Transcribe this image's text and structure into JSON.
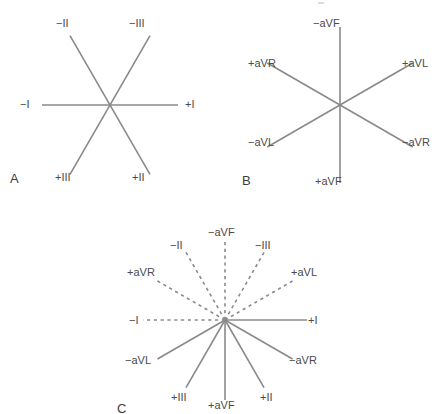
{
  "figure": {
    "background_color": "#ffffff",
    "line_color": "#8a8a8a",
    "text_color": "#4a4a4a",
    "panel_letter_color": "#3c3c3c"
  },
  "panels": [
    {
      "id": "A",
      "letter": "A",
      "caption": "Bipolar limb leads",
      "center": {
        "x": 110,
        "y": 105
      },
      "axes": [
        {
          "name": "lead-I",
          "angle_deg": 0,
          "style": "solid",
          "positive_label": "+I",
          "negative_label": "−I",
          "length": 68
        },
        {
          "name": "lead-II",
          "angle_deg": 60,
          "style": "solid",
          "positive_label": "+II",
          "negative_label": "−II",
          "length": 80
        },
        {
          "name": "lead-III",
          "angle_deg": 120,
          "style": "solid",
          "positive_label": "+III",
          "negative_label": "−III",
          "length": 80
        }
      ],
      "labels": [
        {
          "text": "−II",
          "x": 56,
          "y": 18
        },
        {
          "text": "−III",
          "x": 129,
          "y": 18
        },
        {
          "text": "−I",
          "x": 20,
          "y": 99
        },
        {
          "text": "+I",
          "x": 185,
          "y": 99
        },
        {
          "text": "+III",
          "x": 55,
          "y": 172
        },
        {
          "text": "+II",
          "x": 132,
          "y": 172
        }
      ]
    },
    {
      "id": "B",
      "letter": "B",
      "caption": "Augmented unipolar limb leads",
      "center": {
        "x": 110,
        "y": 105
      },
      "axes": [
        {
          "name": "lead-aVL",
          "angle_deg": 30,
          "style": "solid",
          "positive_label": "+aVL",
          "negative_label": "−aVL",
          "length": 84
        },
        {
          "name": "lead-aVF",
          "angle_deg": 90,
          "style": "solid",
          "positive_label": "+aVF",
          "negative_label": "−aVF",
          "length": 78
        },
        {
          "name": "lead-aVR",
          "angle_deg": 150,
          "style": "solid",
          "positive_label": "+aVR",
          "negative_label": "−aVR",
          "length": 84
        }
      ],
      "labels": [
        {
          "text": "−aVF",
          "x": 83,
          "y": 18
        },
        {
          "text": "+aVR",
          "x": 18,
          "y": 58
        },
        {
          "text": "+aVL",
          "x": 172,
          "y": 58
        },
        {
          "text": "−aVL",
          "x": 18,
          "y": 137
        },
        {
          "text": "−aVR",
          "x": 172,
          "y": 137
        },
        {
          "text": "+aVF",
          "x": 85,
          "y": 176
        }
      ]
    },
    {
      "id": "C",
      "letter": "C",
      "caption": "Complete hexaxial reference system",
      "center": {
        "x": 120,
        "y": 100
      },
      "axes": [
        {
          "name": "lead-I",
          "angle_deg": 0,
          "style_positive": "solid",
          "style_negative": "dashed",
          "positive_label": "+I",
          "negative_label": "−I",
          "length": 82
        },
        {
          "name": "lead-II",
          "angle_deg": 60,
          "style_positive": "solid",
          "style_negative": "dashed",
          "positive_label": "+II",
          "negative_label": "−II",
          "length": 78
        },
        {
          "name": "lead-III",
          "angle_deg": 120,
          "style_positive": "solid",
          "style_negative": "dashed",
          "positive_label": "+III",
          "negative_label": "−III",
          "length": 78
        },
        {
          "name": "lead-aVL",
          "angle_deg": 30,
          "style_positive": "solid",
          "style_negative": "dashed",
          "positive_label": "+aVL",
          "negative_label": "−aVL",
          "length": 78
        },
        {
          "name": "lead-aVF",
          "angle_deg": 90,
          "style_positive": "solid",
          "style_negative": "dashed",
          "positive_label": "+aVF",
          "negative_label": "−aVF",
          "length": 80
        },
        {
          "name": "lead-aVR",
          "angle_deg": 150,
          "style_positive": "solid",
          "style_negative": "dashed",
          "positive_label": "+aVR",
          "negative_label": "−aVR",
          "length": 78
        }
      ],
      "labels": [
        {
          "text": "−aVF",
          "x": 103,
          "y": 7
        },
        {
          "text": "−II",
          "x": 65,
          "y": 20
        },
        {
          "text": "−III",
          "x": 150,
          "y": 20
        },
        {
          "text": "+aVR",
          "x": 22,
          "y": 47
        },
        {
          "text": "+aVL",
          "x": 186,
          "y": 47
        },
        {
          "text": "−I",
          "x": 24,
          "y": 95
        },
        {
          "text": "+I",
          "x": 203,
          "y": 95
        },
        {
          "text": "−aVL",
          "x": 20,
          "y": 135
        },
        {
          "text": "−aVR",
          "x": 184,
          "y": 135
        },
        {
          "text": "+III",
          "x": 66,
          "y": 172
        },
        {
          "text": "+aVF",
          "x": 103,
          "y": 180
        },
        {
          "text": "+II",
          "x": 155,
          "y": 172
        }
      ]
    }
  ],
  "panel_letters": [
    {
      "text": "A",
      "panel": "A",
      "x": 10,
      "y": 172
    },
    {
      "text": "B",
      "panel": "B",
      "x": 12,
      "y": 174
    },
    {
      "text": "C",
      "panel": "C",
      "x": 12,
      "y": 182
    }
  ]
}
